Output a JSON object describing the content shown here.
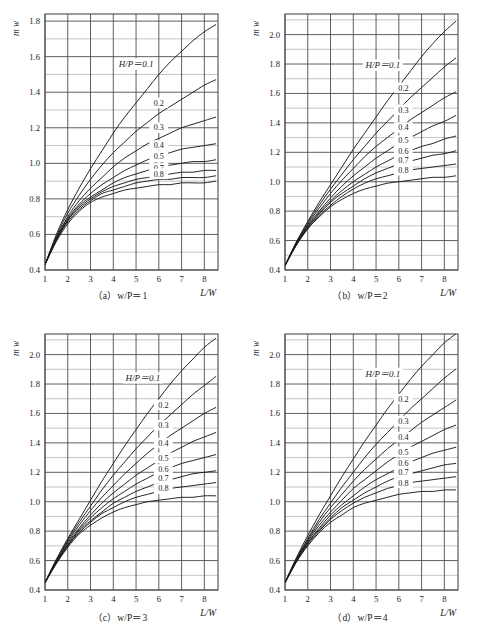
{
  "figure": {
    "background_color": "#ffffff",
    "line_color": "#1a1a1a",
    "grid_major_color": "#4d4d4d",
    "grid_minor_color": "#b5b5b5"
  },
  "panels": [
    {
      "id": "a",
      "caption": "（a）w/P＝1",
      "xlabel": "L/W",
      "ylabel": "m w",
      "head_label": "H/P＝0.1",
      "xticks": [
        "1",
        "2",
        "3",
        "4",
        "5",
        "6",
        "7",
        "8"
      ],
      "yticks": [
        "0.4",
        "0.6",
        "0.8",
        "1.0",
        "1.2",
        "1.4",
        "1.6",
        "1.8"
      ],
      "curve_labels": [
        "0.2",
        "0.3",
        "0.4",
        "0.5",
        "0.6",
        "0.7",
        "0.8"
      ]
    },
    {
      "id": "b",
      "caption": "（b）w/P＝2",
      "xlabel": "L/W",
      "ylabel": "m w",
      "head_label": "H/P＝0.1",
      "xticks": [
        "1",
        "2",
        "3",
        "4",
        "5",
        "6",
        "7",
        "8"
      ],
      "yticks": [
        "0.4",
        "0.6",
        "0.8",
        "1.0",
        "1.2",
        "1.4",
        "1.6",
        "1.8",
        "2.0"
      ],
      "curve_labels": [
        "0.2",
        "0.3",
        "0.4",
        "0.5",
        "0.6",
        "0.7",
        "0.8"
      ]
    },
    {
      "id": "c",
      "caption": "（c）w/P＝3",
      "xlabel": "L/W",
      "ylabel": "m w",
      "head_label": "H/P＝0.1",
      "xticks": [
        "1",
        "2",
        "3",
        "4",
        "5",
        "6",
        "7",
        "8"
      ],
      "yticks": [
        "0.4",
        "0.6",
        "0.8",
        "1.0",
        "1.2",
        "1.4",
        "1.6",
        "1.8",
        "2.0"
      ],
      "curve_labels": [
        "0.2",
        "0.3",
        "0.4",
        "0.5",
        "0.6",
        "0.7",
        "0.8"
      ]
    },
    {
      "id": "d",
      "caption": "（d）w/P＝4",
      "xlabel": "L/W",
      "ylabel": "m w",
      "head_label": "H/P＝0.1",
      "xticks": [
        "1",
        "2",
        "3",
        "4",
        "5",
        "6",
        "7",
        "8"
      ],
      "yticks": [
        "0.4",
        "0.6",
        "0.8",
        "1.0",
        "1.2",
        "1.4",
        "1.6",
        "1.8",
        "2.0"
      ],
      "curve_labels": [
        "0.2",
        "0.3",
        "0.4",
        "0.5",
        "0.6",
        "0.7",
        "0.8"
      ]
    }
  ],
  "chart_data": [
    {
      "type": "line",
      "panel": "a",
      "title": "（a）w/P＝1",
      "xlabel": "L/W",
      "ylabel": "m w",
      "xlim": [
        1,
        8.6
      ],
      "ylim": [
        0.4,
        1.84
      ],
      "xticks": [
        1,
        2,
        3,
        4,
        5,
        6,
        7,
        8
      ],
      "yticks": [
        0.4,
        0.6,
        0.8,
        1.0,
        1.2,
        1.4,
        1.6,
        1.8
      ],
      "grid": true,
      "minor_grid_step_y": 0.1,
      "legend": "inline-curve-labels",
      "x": [
        1,
        1.5,
        2,
        2.5,
        3,
        3.5,
        4,
        4.5,
        5,
        5.5,
        6,
        6.5,
        7,
        7.5,
        8,
        8.5
      ],
      "series": [
        {
          "name": "H/P=0.1",
          "values": [
            0.43,
            0.6,
            0.74,
            0.86,
            0.97,
            1.07,
            1.17,
            1.26,
            1.34,
            1.42,
            1.5,
            1.57,
            1.63,
            1.69,
            1.74,
            1.78
          ]
        },
        {
          "name": "H/P=0.2",
          "values": [
            0.43,
            0.59,
            0.72,
            0.82,
            0.91,
            0.99,
            1.06,
            1.12,
            1.18,
            1.23,
            1.28,
            1.32,
            1.36,
            1.4,
            1.44,
            1.47
          ]
        },
        {
          "name": "H/P=0.3",
          "values": [
            0.43,
            0.58,
            0.7,
            0.79,
            0.86,
            0.92,
            0.98,
            1.03,
            1.07,
            1.11,
            1.14,
            1.17,
            1.2,
            1.22,
            1.24,
            1.26
          ]
        },
        {
          "name": "H/P=0.4",
          "values": [
            0.43,
            0.58,
            0.69,
            0.77,
            0.83,
            0.88,
            0.92,
            0.96,
            0.99,
            1.02,
            1.04,
            1.06,
            1.08,
            1.09,
            1.1,
            1.11
          ]
        },
        {
          "name": "H/P=0.5",
          "values": [
            0.43,
            0.57,
            0.68,
            0.76,
            0.81,
            0.85,
            0.89,
            0.92,
            0.94,
            0.96,
            0.98,
            0.99,
            1.0,
            1.01,
            1.01,
            1.02
          ]
        },
        {
          "name": "H/P=0.6",
          "values": [
            0.43,
            0.57,
            0.68,
            0.75,
            0.8,
            0.84,
            0.87,
            0.89,
            0.91,
            0.92,
            0.93,
            0.94,
            0.95,
            0.95,
            0.96,
            0.96
          ]
        },
        {
          "name": "H/P=0.7",
          "values": [
            0.43,
            0.57,
            0.67,
            0.74,
            0.79,
            0.83,
            0.85,
            0.87,
            0.89,
            0.9,
            0.91,
            0.91,
            0.92,
            0.92,
            0.92,
            0.93
          ]
        },
        {
          "name": "H/P=0.8",
          "values": [
            0.43,
            0.56,
            0.66,
            0.73,
            0.78,
            0.81,
            0.83,
            0.85,
            0.86,
            0.87,
            0.88,
            0.88,
            0.89,
            0.89,
            0.89,
            0.9
          ]
        }
      ]
    },
    {
      "type": "line",
      "panel": "b",
      "title": "（b）w/P＝2",
      "xlabel": "L/W",
      "ylabel": "m w",
      "xlim": [
        1,
        8.6
      ],
      "ylim": [
        0.4,
        2.14
      ],
      "xticks": [
        1,
        2,
        3,
        4,
        5,
        6,
        7,
        8
      ],
      "yticks": [
        0.4,
        0.6,
        0.8,
        1.0,
        1.2,
        1.4,
        1.6,
        1.8,
        2.0
      ],
      "grid": true,
      "minor_grid_step_y": 0.1,
      "legend": "inline-curve-labels",
      "x": [
        1,
        1.5,
        2,
        2.5,
        3,
        3.5,
        4,
        4.5,
        5,
        5.5,
        6,
        6.5,
        7,
        7.5,
        8,
        8.5
      ],
      "series": [
        {
          "name": "H/P=0.1",
          "values": [
            0.43,
            0.59,
            0.73,
            0.86,
            0.98,
            1.1,
            1.22,
            1.33,
            1.44,
            1.55,
            1.65,
            1.75,
            1.85,
            1.94,
            2.02,
            2.09
          ]
        },
        {
          "name": "H/P=0.2",
          "values": [
            0.43,
            0.59,
            0.72,
            0.84,
            0.95,
            1.05,
            1.15,
            1.24,
            1.33,
            1.41,
            1.49,
            1.57,
            1.64,
            1.71,
            1.78,
            1.84
          ]
        },
        {
          "name": "H/P=0.3",
          "values": [
            0.43,
            0.58,
            0.71,
            0.82,
            0.92,
            1.01,
            1.09,
            1.17,
            1.24,
            1.3,
            1.36,
            1.42,
            1.47,
            1.52,
            1.57,
            1.61
          ]
        },
        {
          "name": "H/P=0.4",
          "values": [
            0.43,
            0.58,
            0.7,
            0.8,
            0.89,
            0.97,
            1.04,
            1.1,
            1.16,
            1.21,
            1.26,
            1.3,
            1.34,
            1.38,
            1.41,
            1.45
          ]
        },
        {
          "name": "H/P=0.5",
          "values": [
            0.43,
            0.58,
            0.69,
            0.79,
            0.87,
            0.94,
            1.0,
            1.05,
            1.1,
            1.14,
            1.18,
            1.21,
            1.24,
            1.26,
            1.29,
            1.31
          ]
        },
        {
          "name": "H/P=0.6",
          "values": [
            0.43,
            0.57,
            0.69,
            0.78,
            0.86,
            0.92,
            0.97,
            1.02,
            1.06,
            1.09,
            1.12,
            1.14,
            1.16,
            1.18,
            1.19,
            1.21
          ]
        },
        {
          "name": "H/P=0.7",
          "values": [
            0.43,
            0.57,
            0.68,
            0.77,
            0.84,
            0.9,
            0.95,
            0.99,
            1.02,
            1.04,
            1.06,
            1.08,
            1.09,
            1.1,
            1.11,
            1.12
          ]
        },
        {
          "name": "H/P=0.8",
          "values": [
            0.43,
            0.57,
            0.68,
            0.76,
            0.83,
            0.88,
            0.92,
            0.95,
            0.97,
            0.99,
            1.0,
            1.01,
            1.02,
            1.03,
            1.03,
            1.04
          ]
        }
      ]
    },
    {
      "type": "line",
      "panel": "c",
      "title": "（c）w/P＝3",
      "xlabel": "L/W",
      "ylabel": "m w",
      "xlim": [
        1,
        8.6
      ],
      "ylim": [
        0.4,
        2.14
      ],
      "xticks": [
        1,
        2,
        3,
        4,
        5,
        6,
        7,
        8
      ],
      "yticks": [
        0.4,
        0.6,
        0.8,
        1.0,
        1.2,
        1.4,
        1.6,
        1.8,
        2.0
      ],
      "grid": true,
      "minor_grid_step_y": 0.1,
      "legend": "inline-curve-labels",
      "x": [
        1,
        1.5,
        2,
        2.5,
        3,
        3.5,
        4,
        4.5,
        5,
        5.5,
        6,
        6.5,
        7,
        7.5,
        8,
        8.5
      ],
      "series": [
        {
          "name": "H/P=0.1",
          "values": [
            0.45,
            0.61,
            0.75,
            0.88,
            1.01,
            1.14,
            1.26,
            1.38,
            1.49,
            1.6,
            1.7,
            1.8,
            1.89,
            1.97,
            2.05,
            2.11
          ]
        },
        {
          "name": "H/P=0.2",
          "values": [
            0.45,
            0.6,
            0.74,
            0.86,
            0.97,
            1.08,
            1.18,
            1.27,
            1.36,
            1.44,
            1.52,
            1.59,
            1.66,
            1.73,
            1.79,
            1.85
          ]
        },
        {
          "name": "H/P=0.3",
          "values": [
            0.45,
            0.6,
            0.73,
            0.84,
            0.94,
            1.03,
            1.11,
            1.19,
            1.26,
            1.33,
            1.39,
            1.45,
            1.5,
            1.55,
            1.6,
            1.64
          ]
        },
        {
          "name": "H/P=0.4",
          "values": [
            0.45,
            0.59,
            0.72,
            0.82,
            0.91,
            0.99,
            1.06,
            1.12,
            1.18,
            1.23,
            1.28,
            1.33,
            1.37,
            1.41,
            1.44,
            1.47
          ]
        },
        {
          "name": "H/P=0.5",
          "values": [
            0.45,
            0.59,
            0.71,
            0.81,
            0.89,
            0.96,
            1.02,
            1.07,
            1.12,
            1.16,
            1.2,
            1.23,
            1.26,
            1.28,
            1.3,
            1.32
          ]
        },
        {
          "name": "H/P=0.6",
          "values": [
            0.45,
            0.59,
            0.7,
            0.8,
            0.87,
            0.93,
            0.99,
            1.03,
            1.07,
            1.1,
            1.13,
            1.15,
            1.17,
            1.19,
            1.2,
            1.21
          ]
        },
        {
          "name": "H/P=0.7",
          "values": [
            0.45,
            0.58,
            0.7,
            0.79,
            0.86,
            0.92,
            0.96,
            1.0,
            1.03,
            1.05,
            1.07,
            1.09,
            1.1,
            1.11,
            1.12,
            1.13
          ]
        },
        {
          "name": "H/P=0.8",
          "values": [
            0.45,
            0.58,
            0.69,
            0.78,
            0.84,
            0.89,
            0.93,
            0.96,
            0.98,
            1.0,
            1.01,
            1.02,
            1.03,
            1.03,
            1.04,
            1.04
          ]
        }
      ]
    },
    {
      "type": "line",
      "panel": "d",
      "title": "（d）w/P＝4",
      "xlabel": "L/W",
      "ylabel": "m w",
      "xlim": [
        1,
        8.6
      ],
      "ylim": [
        0.4,
        2.14
      ],
      "xticks": [
        1,
        2,
        3,
        4,
        5,
        6,
        7,
        8
      ],
      "yticks": [
        0.4,
        0.6,
        0.8,
        1.0,
        1.2,
        1.4,
        1.6,
        1.8,
        2.0
      ],
      "grid": true,
      "minor_grid_step_y": 0.1,
      "legend": "inline-curve-labels",
      "x": [
        1,
        1.5,
        2,
        2.5,
        3,
        3.5,
        4,
        4.5,
        5,
        5.5,
        6,
        6.5,
        7,
        7.5,
        8,
        8.5
      ],
      "series": [
        {
          "name": "H/P=0.1",
          "values": [
            0.45,
            0.62,
            0.77,
            0.91,
            1.04,
            1.17,
            1.29,
            1.41,
            1.52,
            1.63,
            1.73,
            1.83,
            1.92,
            2.0,
            2.08,
            2.14
          ]
        },
        {
          "name": "H/P=0.2",
          "values": [
            0.45,
            0.61,
            0.75,
            0.88,
            0.99,
            1.1,
            1.2,
            1.3,
            1.39,
            1.47,
            1.55,
            1.63,
            1.7,
            1.77,
            1.84,
            1.9
          ]
        },
        {
          "name": "H/P=0.3",
          "values": [
            0.45,
            0.61,
            0.74,
            0.86,
            0.96,
            1.05,
            1.14,
            1.22,
            1.29,
            1.36,
            1.42,
            1.48,
            1.54,
            1.59,
            1.64,
            1.69
          ]
        },
        {
          "name": "H/P=0.4",
          "values": [
            0.45,
            0.6,
            0.73,
            0.84,
            0.93,
            1.01,
            1.09,
            1.15,
            1.21,
            1.27,
            1.32,
            1.37,
            1.41,
            1.45,
            1.49,
            1.52
          ]
        },
        {
          "name": "H/P=0.5",
          "values": [
            0.45,
            0.6,
            0.72,
            0.82,
            0.91,
            0.98,
            1.04,
            1.1,
            1.15,
            1.19,
            1.23,
            1.27,
            1.3,
            1.33,
            1.35,
            1.37
          ]
        },
        {
          "name": "H/P=0.6",
          "values": [
            0.45,
            0.6,
            0.72,
            0.81,
            0.89,
            0.96,
            1.01,
            1.06,
            1.1,
            1.14,
            1.17,
            1.19,
            1.21,
            1.23,
            1.25,
            1.26
          ]
        },
        {
          "name": "H/P=0.7",
          "values": [
            0.45,
            0.59,
            0.71,
            0.8,
            0.88,
            0.94,
            0.99,
            1.03,
            1.06,
            1.09,
            1.11,
            1.13,
            1.14,
            1.15,
            1.16,
            1.17
          ]
        },
        {
          "name": "H/P=0.8",
          "values": [
            0.45,
            0.59,
            0.7,
            0.79,
            0.86,
            0.91,
            0.96,
            0.99,
            1.01,
            1.03,
            1.05,
            1.06,
            1.07,
            1.07,
            1.08,
            1.08
          ]
        }
      ]
    }
  ]
}
